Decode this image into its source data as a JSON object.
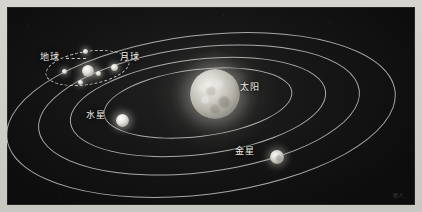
{
  "figure": {
    "kind": "solar-system-diagram",
    "background_color": "#151515",
    "orbit_color": "#e2e2de",
    "label_color": "#f0efe9",
    "paper_color": "#d2d0cb"
  },
  "bodies": [
    {
      "id": "sun",
      "label": "太阳",
      "role": "star",
      "size": "large"
    },
    {
      "id": "mercury",
      "label": "水星",
      "role": "planet",
      "size": "small"
    },
    {
      "id": "venus",
      "label": "金星",
      "role": "planet",
      "size": "small"
    },
    {
      "id": "earth",
      "label": "地球",
      "role": "planet",
      "size": "small"
    },
    {
      "id": "moon",
      "label": "月球",
      "role": "satellite",
      "size": "tiny"
    }
  ],
  "labels": {
    "earth": "地球",
    "moon": "月球",
    "sun": "太阳",
    "mercury": "水星",
    "venus": "金星"
  },
  "orbits": [
    {
      "name": "mercury-orbit",
      "style": "solid"
    },
    {
      "name": "venus-orbit",
      "style": "solid"
    },
    {
      "name": "earth-orbit",
      "style": "solid"
    },
    {
      "name": "outer-orbit",
      "style": "solid"
    },
    {
      "name": "moon-orbit",
      "style": "dashed"
    }
  ],
  "watermark": "图片"
}
